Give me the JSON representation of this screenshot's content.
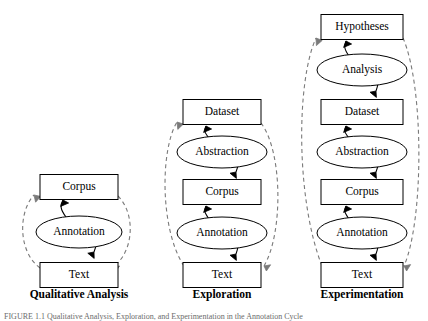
{
  "figure": {
    "caption": "FIGURE 1.1  Qualitative Analysis, Exploration, and Experimentation in the Annotation Cycle",
    "panels": [
      {
        "id": "qualitative-analysis",
        "title": "Qualitative Analysis",
        "title_x": 79,
        "title_y": 295,
        "nodes": [
          {
            "id": "corpus",
            "label": "Corpus",
            "shape": "box",
            "cx": 79,
            "cy": 187,
            "w": 78,
            "h": 25
          },
          {
            "id": "annotation",
            "label": "Annotation",
            "shape": "ellipse",
            "cx": 79,
            "cy": 232,
            "rx": 43,
            "ry": 16
          },
          {
            "id": "text",
            "label": "Text",
            "shape": "box",
            "cx": 79,
            "cy": 275,
            "w": 78,
            "h": 25
          }
        ],
        "solid_edges": [
          {
            "id": "annotation-to-corpus",
            "from": "annotation",
            "to": "corpus",
            "d": "M 66 217 C 60 209 60 205 63 200",
            "arrow": "M 63 200 l 5.6 3.0 l -8.0 3.4 Z"
          },
          {
            "id": "text-to-annotation",
            "from": "text",
            "to": "annotation",
            "d": "M 92 217 C 98 224 99 240 94 252",
            "arrow": "M 94 252 l 0.2 6.4 l -6.4 -5.2 Z"
          }
        ],
        "dashed_edges": [
          {
            "id": "text-to-corpus-left",
            "d": "M 40 268 C 18 252 18 212 34 195",
            "arrow": "M 34 195 l 6.6 1.4 l -5.0 5.8 Z"
          },
          {
            "id": "corpus-to-text-right",
            "d": "M 118 196 C 136 214 134 252 113 267",
            "arrow": "M 113 267 l 6.6 -1.0 l -4.4 6.2 Z"
          }
        ]
      },
      {
        "id": "exploration",
        "title": "Exploration",
        "title_x": 222,
        "title_y": 295,
        "nodes": [
          {
            "id": "dataset",
            "label": "Dataset",
            "shape": "box",
            "cx": 222,
            "cy": 112,
            "w": 78,
            "h": 25
          },
          {
            "id": "abstraction",
            "label": "Abstraction",
            "shape": "ellipse",
            "cx": 222,
            "cy": 152,
            "rx": 45,
            "ry": 16
          },
          {
            "id": "corpus",
            "label": "Corpus",
            "shape": "box",
            "cx": 222,
            "cy": 192,
            "w": 78,
            "h": 25
          },
          {
            "id": "annotation",
            "label": "Annotation",
            "shape": "ellipse",
            "cx": 222,
            "cy": 233,
            "rx": 45,
            "ry": 16
          },
          {
            "id": "text",
            "label": "Text",
            "shape": "box",
            "cx": 222,
            "cy": 275,
            "w": 78,
            "h": 25
          }
        ],
        "solid_edges": [
          {
            "id": "abstraction-to-dataset",
            "from": "abstraction",
            "to": "dataset",
            "d": "M 209 138 C 204 132 204 130 206 126",
            "arrow": "M 206 126 l 5.6 3.0 l -8.0 3.4 Z"
          },
          {
            "id": "corpus-to-abstraction",
            "from": "corpus",
            "to": "abstraction",
            "d": "M 235 138 C 240 146 240 162 236 172",
            "arrow": "M 236 172 l 0.4 6.4 l -6.4 -5.2 Z"
          },
          {
            "id": "annotation-to-corpus",
            "from": "annotation",
            "to": "corpus",
            "d": "M 209 219 C 204 212 204 210 206 206",
            "arrow": "M 206 206 l 5.6 3.0 l -8.0 3.4 Z"
          },
          {
            "id": "text-to-annotation",
            "from": "text",
            "to": "annotation",
            "d": "M 235 219 C 240 227 240 243 236 254",
            "arrow": "M 236 254 l 0.4 6.4 l -6.4 -5.2 Z"
          }
        ],
        "dashed_edges": [
          {
            "id": "text-to-dataset-left",
            "d": "M 184 266 C 160 230 160 150 177 122",
            "arrow": "M 177 122 l 6.4 2.0 l -5.6 5.4 Z"
          },
          {
            "id": "dataset-to-text-right",
            "d": "M 261 123 C 283 152 283 234 264 266",
            "arrow": "M 264 266 l 6.6 -1.2 l -4.2 6.2 Z"
          }
        ]
      },
      {
        "id": "experimentation",
        "title": "Experimentation",
        "title_x": 362,
        "title_y": 295,
        "nodes": [
          {
            "id": "hypotheses",
            "label": "Hypotheses",
            "shape": "box",
            "cx": 362,
            "cy": 27,
            "w": 82,
            "h": 25
          },
          {
            "id": "analysis",
            "label": "Analysis",
            "shape": "ellipse",
            "cx": 362,
            "cy": 70,
            "rx": 45,
            "ry": 16
          },
          {
            "id": "dataset",
            "label": "Dataset",
            "shape": "box",
            "cx": 362,
            "cy": 112,
            "w": 82,
            "h": 25
          },
          {
            "id": "abstraction",
            "label": "Abstraction",
            "shape": "ellipse",
            "cx": 362,
            "cy": 152,
            "rx": 45,
            "ry": 16
          },
          {
            "id": "corpus",
            "label": "Corpus",
            "shape": "box",
            "cx": 362,
            "cy": 192,
            "w": 82,
            "h": 25
          },
          {
            "id": "annotation",
            "label": "Annotation",
            "shape": "ellipse",
            "cx": 362,
            "cy": 233,
            "rx": 45,
            "ry": 16
          },
          {
            "id": "text",
            "label": "Text",
            "shape": "box",
            "cx": 362,
            "cy": 275,
            "w": 82,
            "h": 25
          }
        ],
        "solid_edges": [
          {
            "id": "analysis-to-hypotheses",
            "from": "analysis",
            "to": "hypotheses",
            "d": "M 349 56 C 344 49 344 46 346 41",
            "arrow": "M 346 41 l 5.6 3.0 l -8.0 3.4 Z"
          },
          {
            "id": "dataset-to-analysis",
            "from": "dataset",
            "to": "analysis",
            "d": "M 375 56 C 380 64 380 80 376 91",
            "arrow": "M 376 91 l 0.4 6.4 l -6.4 -5.2 Z"
          },
          {
            "id": "abstraction-to-dataset",
            "from": "abstraction",
            "to": "dataset",
            "d": "M 349 138 C 344 132 344 130 346 126",
            "arrow": "M 346 126 l 5.6 3.0 l -8.0 3.4 Z"
          },
          {
            "id": "corpus-to-abstraction",
            "from": "corpus",
            "to": "abstraction",
            "d": "M 375 138 C 380 146 380 162 376 172",
            "arrow": "M 376 172 l 0.4 6.4 l -6.4 -5.2 Z"
          },
          {
            "id": "annotation-to-corpus",
            "from": "annotation",
            "to": "corpus",
            "d": "M 349 219 C 344 212 344 210 346 206",
            "arrow": "M 346 206 l 5.6 3.0 l -8.0 3.4 Z"
          },
          {
            "id": "text-to-annotation",
            "from": "text",
            "to": "annotation",
            "d": "M 375 219 C 380 227 380 243 376 254",
            "arrow": "M 376 254 l 0.4 6.4 l -6.4 -5.2 Z"
          }
        ],
        "dashed_edges": [
          {
            "id": "text-to-hypotheses-left",
            "d": "M 322 266 C 296 200 296 82 316 38",
            "arrow": "M 316 38 l 6.2 2.4 l -5.8 5.2 Z"
          },
          {
            "id": "hypotheses-to-text-right",
            "d": "M 403 38 C 424 86 424 220 404 266",
            "arrow": "M 404 266 l 6.6 -1.4 l -4.0 6.4 Z"
          }
        ]
      }
    ]
  }
}
